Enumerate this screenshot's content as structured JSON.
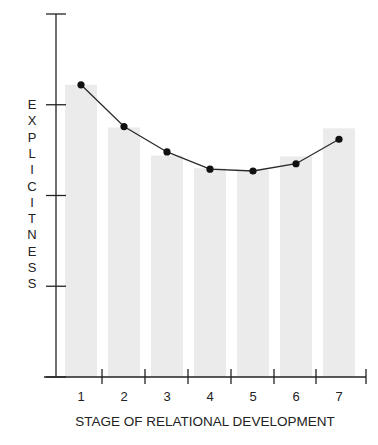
{
  "chart_data": {
    "type": "bar",
    "title": "",
    "xlabel": "STAGE OF RELATIONAL DEVELOPMENT",
    "ylabel": "EXPLICITNESS",
    "categories": [
      "1",
      "2",
      "3",
      "4",
      "5",
      "6",
      "7"
    ],
    "series": [
      {
        "name": "bars",
        "kind": "bar",
        "values": [
          3.22,
          2.75,
          2.44,
          2.3,
          2.28,
          2.43,
          2.74
        ]
      },
      {
        "name": "line",
        "kind": "line",
        "values": [
          3.22,
          2.76,
          2.48,
          2.29,
          2.27,
          2.35,
          2.62
        ]
      }
    ],
    "ylim": [
      0,
      4
    ],
    "yticks": [
      0,
      1,
      2,
      3,
      4
    ],
    "ytick_labels_visible": false,
    "grid": false,
    "legend": "none"
  },
  "colors": {
    "bar": "#ebebeb",
    "line": "#2a2a2a",
    "axis": "#222222"
  }
}
